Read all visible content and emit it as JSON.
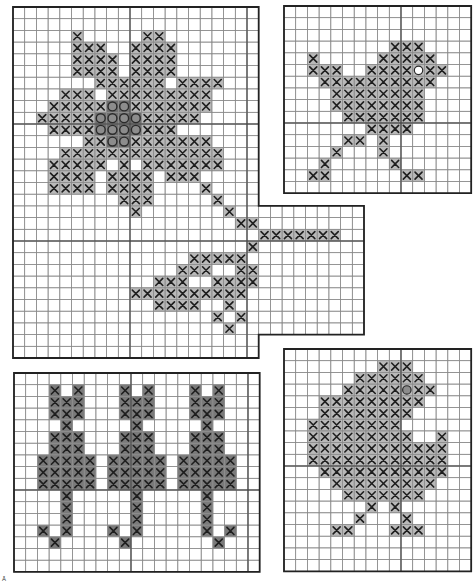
{
  "page": {
    "footnote_mark": "Â"
  },
  "style": {
    "cell": 11.7,
    "fill_x": "#b9b9b9",
    "fill_cat": "#7a7a7a",
    "fill_o": "#6f6f6f",
    "o_stroke": "#2a2a2a",
    "x_stroke": "#1e1e1e",
    "grid_minor": "#8a8a8a",
    "grid_major": "#444444",
    "border": "#222222"
  },
  "charts": [
    {
      "id": "flower",
      "name": "Flower with stem and leaves",
      "x": 12,
      "y": 6,
      "cols": 21,
      "rows": 30,
      "extension": {
        "col": 21,
        "row": 17,
        "cols": 9,
        "rows": 11
      },
      "fill": "fill_x",
      "stitches": {
        "2": [
          5,
          11,
          12
        ],
        "3": [
          5,
          6,
          7,
          10,
          11,
          12,
          13
        ],
        "4": [
          5,
          6,
          7,
          8,
          10,
          11,
          12,
          13
        ],
        "5": [
          5,
          6,
          7,
          8,
          10,
          11,
          12,
          13
        ],
        "6": [
          7,
          8,
          9,
          10,
          11,
          12,
          14,
          15,
          16,
          17
        ],
        "7": [
          4,
          5,
          6,
          8,
          9,
          10,
          11,
          12,
          13,
          14,
          15,
          16
        ],
        "8": [
          3,
          4,
          5,
          6,
          7,
          10,
          11,
          12,
          13,
          14,
          15,
          16
        ],
        "9": [
          2,
          3,
          4,
          5,
          6,
          11,
          12,
          13,
          14,
          15
        ],
        "10": [
          3,
          4,
          5,
          6,
          11,
          12,
          13
        ],
        "11": [
          6,
          7,
          10,
          11,
          12,
          13,
          14,
          15,
          16
        ],
        "12": [
          4,
          5,
          6,
          7,
          8,
          9,
          10,
          11,
          12,
          13,
          14,
          15,
          16,
          17
        ],
        "13": [
          3,
          4,
          5,
          6,
          7,
          9,
          11,
          12,
          13,
          14,
          15,
          16,
          17
        ],
        "14": [
          3,
          4,
          5,
          6,
          8,
          9,
          10,
          11,
          13,
          14,
          15
        ],
        "15": [
          3,
          4,
          5,
          6,
          8,
          9,
          10,
          11,
          16
        ],
        "16": [
          9,
          10,
          11,
          17
        ],
        "17": [
          10,
          18
        ],
        "18": [
          19,
          20
        ],
        "19": [
          21,
          22,
          23,
          24,
          25,
          26,
          27
        ],
        "20": [
          20
        ],
        "21": [
          15,
          16,
          17,
          18,
          19
        ],
        "22": [
          14,
          15,
          16,
          19,
          20
        ],
        "23": [
          12,
          13,
          14,
          17,
          18,
          19,
          20
        ],
        "24": [
          10,
          11,
          12,
          13,
          14,
          15,
          16,
          17,
          18,
          19
        ],
        "25": [
          12,
          13,
          14,
          15,
          18
        ],
        "26": [
          17,
          19
        ],
        "27": [
          18
        ]
      },
      "o_stitches": {
        "8": [
          8,
          9
        ],
        "9": [
          7,
          8,
          9,
          10
        ],
        "10": [
          7,
          8,
          9,
          10
        ],
        "11": [
          8,
          9
        ]
      }
    },
    {
      "id": "bird",
      "name": "Bird",
      "x": 283,
      "y": 5,
      "cols": 16,
      "rows": 16,
      "fill": "fill_x",
      "stitches": {
        "3": [
          9,
          10,
          11
        ],
        "4": [
          2,
          8,
          9,
          10,
          11,
          12
        ],
        "5": [
          2,
          3,
          4,
          7,
          8,
          9,
          10,
          12,
          13
        ],
        "6": [
          3,
          4,
          5,
          6,
          7,
          8,
          9,
          10,
          11,
          12
        ],
        "7": [
          4,
          5,
          6,
          7,
          8,
          9,
          10,
          11
        ],
        "8": [
          4,
          5,
          6,
          7,
          8,
          9,
          10,
          11
        ],
        "9": [
          5,
          6,
          7,
          8,
          9,
          10,
          11
        ],
        "10": [
          7,
          8,
          9,
          10
        ],
        "11": [
          5,
          6,
          8
        ],
        "12": [
          4,
          8
        ],
        "13": [
          3,
          9
        ],
        "14": [
          2,
          3,
          10,
          11
        ]
      },
      "eye": {
        "row": 5,
        "col": 11
      }
    },
    {
      "id": "cats",
      "name": "Three cats",
      "x": 13,
      "y": 372,
      "cols": 21,
      "rows": 17,
      "fill": "fill_cat",
      "stitches": {
        "1": [
          3,
          5,
          9,
          11,
          15,
          17
        ],
        "2": [
          3,
          4,
          5,
          9,
          10,
          11,
          15,
          16,
          17
        ],
        "3": [
          3,
          4,
          5,
          9,
          10,
          11,
          15,
          16,
          17
        ],
        "4": [
          4,
          10,
          16
        ],
        "5": [
          3,
          4,
          5,
          9,
          10,
          11,
          15,
          16,
          17
        ],
        "6": [
          3,
          4,
          5,
          9,
          10,
          11,
          15,
          16,
          17
        ],
        "7": [
          2,
          3,
          4,
          5,
          6,
          8,
          9,
          10,
          11,
          12,
          14,
          15,
          16,
          17,
          18
        ],
        "8": [
          2,
          3,
          4,
          5,
          6,
          8,
          9,
          10,
          11,
          12,
          14,
          15,
          16,
          17,
          18
        ],
        "9": [
          2,
          3,
          4,
          5,
          6,
          8,
          9,
          10,
          11,
          12,
          14,
          15,
          16,
          17,
          18
        ],
        "10": [
          4,
          10,
          16
        ],
        "11": [
          4,
          10,
          16
        ],
        "12": [
          4,
          10,
          16
        ],
        "13": [
          2,
          4,
          8,
          10,
          16,
          18
        ],
        "14": [
          3,
          9,
          17
        ]
      }
    },
    {
      "id": "chick",
      "name": "Chick",
      "x": 283,
      "y": 348,
      "cols": 16,
      "rows": 19,
      "fill": "fill_x",
      "stitches": {
        "1": [
          8,
          9,
          10
        ],
        "2": [
          6,
          7,
          8,
          9,
          10,
          11
        ],
        "3": [
          5,
          6,
          7,
          8,
          9,
          11,
          12
        ],
        "4": [
          3,
          4,
          5,
          6,
          7,
          8,
          9,
          10,
          11
        ],
        "5": [
          3,
          4,
          5,
          6,
          7,
          8,
          9,
          10
        ],
        "6": [
          2,
          3,
          4,
          5,
          6,
          7,
          8,
          9
        ],
        "7": [
          2,
          3,
          4,
          5,
          6,
          7,
          8,
          9,
          10,
          13
        ],
        "8": [
          2,
          3,
          4,
          5,
          6,
          7,
          8,
          9,
          10,
          11,
          12,
          13
        ],
        "9": [
          2,
          3,
          4,
          5,
          6,
          7,
          8,
          9,
          10,
          11,
          12,
          13
        ],
        "10": [
          3,
          4,
          5,
          6,
          7,
          8,
          9,
          10,
          11,
          12,
          13
        ],
        "11": [
          4,
          5,
          6,
          7,
          8,
          9,
          10,
          11,
          12
        ],
        "12": [
          5,
          6,
          7,
          8,
          9,
          10,
          11
        ],
        "13": [
          7,
          9
        ],
        "14": [
          6,
          10
        ],
        "15": [
          4,
          5,
          9,
          10,
          11
        ]
      },
      "eye": {
        "row": 3,
        "col": 10
      }
    }
  ]
}
